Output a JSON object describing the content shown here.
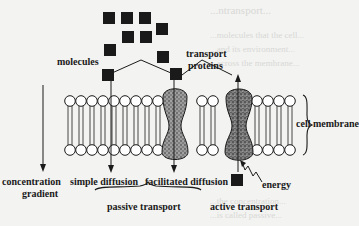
{
  "figure": {
    "labels": {
      "molecules": "molecules",
      "transport_proteins_line1": "transport",
      "transport_proteins_line2": "proteins",
      "cell_membrane": "cell membrane",
      "concentration_gradient_line1": "concentration",
      "concentration_gradient_line2": "gradient",
      "simple_diffusion": "simple diffusion",
      "facilitated_diffusion": "facilitated diffusion",
      "passive_transport": "passive transport",
      "active_transport": "active transport",
      "energy": "energy"
    },
    "colors": {
      "ink": "#1a1a1a",
      "background": "#f3f3f1",
      "protein_fill": "#8a8a8a"
    },
    "molecules": [
      {
        "x": 103,
        "y": 12
      },
      {
        "x": 121,
        "y": 12
      },
      {
        "x": 139,
        "y": 12
      },
      {
        "x": 156,
        "y": 23
      },
      {
        "x": 122,
        "y": 31
      },
      {
        "x": 140,
        "y": 31
      },
      {
        "x": 104,
        "y": 44
      },
      {
        "x": 157,
        "y": 51
      },
      {
        "x": 102,
        "y": 69
      },
      {
        "x": 170,
        "y": 68
      },
      {
        "x": 231,
        "y": 174
      }
    ],
    "bleed_through_text": [
      "...ntransport...",
      "...molecules that the cell...",
      "...and its environment...",
      "...across the membrane...",
      "...the concentration...",
      "...is called passive..."
    ]
  }
}
